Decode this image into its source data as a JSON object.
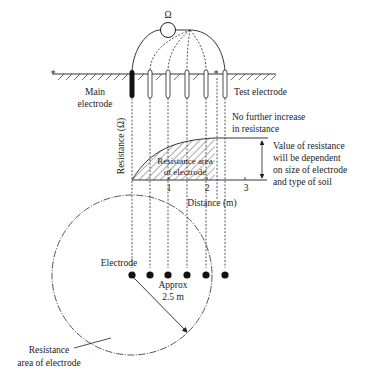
{
  "diagram": {
    "meter_symbol": "Ω",
    "labels": {
      "main_electrode_line1": "Main",
      "main_electrode_line2": "electrode",
      "test_electrode": "Test electrode",
      "no_increase_line1": "No further increase",
      "no_increase_line2": "in resistance",
      "value_note_line1": "Value of resistance",
      "value_note_line2": "will be dependent",
      "value_note_line3": "on size of electrode",
      "value_note_line4": "and type of soil",
      "resistance_area_line1": "Resistance area",
      "resistance_area_line2": "of electrode",
      "electrode": "Electrode",
      "approx_line1": "Approx",
      "approx_line2": "2.5 m",
      "plan_area_line1": "Resistance",
      "plan_area_line2": "area of electrode"
    },
    "axes": {
      "ylabel": "Resistance (Ω)",
      "xlabel": "Distance (m)",
      "xticks": [
        "1",
        "2",
        "3"
      ]
    },
    "electrode_count": 6,
    "icons": {
      "meter": "ohmmeter-circle-icon",
      "ground": "ground-hatch-icon",
      "marker": "asterisk-icon"
    }
  }
}
